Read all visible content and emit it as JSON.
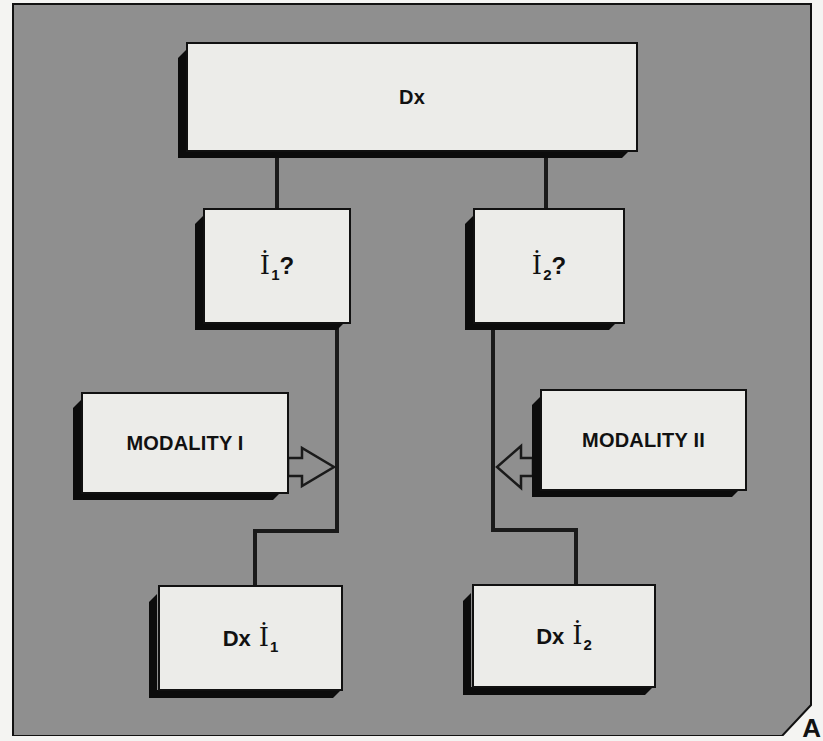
{
  "diagram": {
    "panel_color": "#8f8f8f",
    "box_fill": "#ecece9",
    "line_color": "#1a1a1a",
    "corner_label": "A",
    "nodes": {
      "root": {
        "label": "Dx"
      },
      "question_1": {
        "var": "İ",
        "sub": "1",
        "suffix": "?"
      },
      "question_2": {
        "var": "İ",
        "sub": "2",
        "suffix": "?"
      },
      "modality_1": {
        "label": "MODALITY I"
      },
      "modality_2": {
        "label": "MODALITY II"
      },
      "result_1": {
        "prefix": "Dx",
        "var": "İ",
        "sub": "1"
      },
      "result_2": {
        "prefix": "Dx",
        "var": "İ",
        "sub": "2"
      }
    },
    "edges": [
      {
        "from": "root",
        "to": "question_1"
      },
      {
        "from": "root",
        "to": "question_2"
      },
      {
        "from": "question_1",
        "to": "result_1"
      },
      {
        "from": "question_2",
        "to": "result_2"
      },
      {
        "from": "modality_1",
        "to": "question_1-result_1 line",
        "type": "arrow"
      },
      {
        "from": "modality_2",
        "to": "question_2-result_2 line",
        "type": "arrow"
      }
    ]
  }
}
